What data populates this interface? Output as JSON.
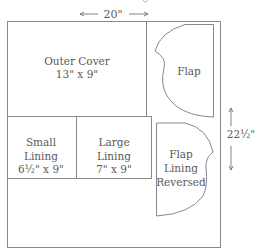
{
  "diagram": {
    "width_label": "20\"",
    "height_label": "22½\"",
    "pieces": [
      {
        "name": "Outer Cover",
        "line1": "Outer Cover",
        "line2": "13\" x 9\""
      },
      {
        "name": "Flap",
        "line1": "Flap"
      },
      {
        "name": "Small Lining",
        "line1": "Small",
        "line2": "Lining",
        "line3": "6½\" x 9\""
      },
      {
        "name": "Large Lining",
        "line1": "Large",
        "line2": "Lining",
        "line3": "7\" x 9\""
      },
      {
        "name": "Flap Lining Reversed",
        "line1": "Flap",
        "line2": "Lining",
        "line3": "Reversed"
      }
    ],
    "colors": {
      "line": "#888888",
      "text": "#5a5a5a",
      "accent": "#e8a860"
    }
  }
}
